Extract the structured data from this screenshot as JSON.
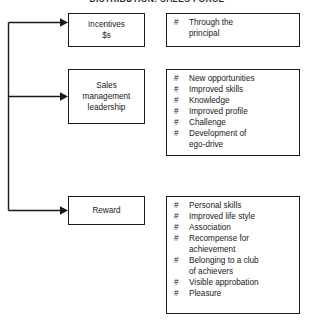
{
  "title": "DISTRIBUTION: SALES FORCE",
  "bullet_marker": "#",
  "colors": {
    "line": "#1a1a1a",
    "text": "#1a1a1a",
    "background": "#ffffff"
  },
  "rows": [
    {
      "driver": {
        "lines": [
          "Incentives",
          "$s"
        ]
      },
      "outcomes": [
        {
          "lines": [
            "Through the",
            "principal"
          ]
        }
      ]
    },
    {
      "driver": {
        "lines": [
          "Sales",
          "management",
          "leadership"
        ]
      },
      "outcomes": [
        {
          "lines": [
            "New opportunities"
          ]
        },
        {
          "lines": [
            "Improved skills"
          ]
        },
        {
          "lines": [
            "Knowledge"
          ]
        },
        {
          "lines": [
            "Improved profile"
          ]
        },
        {
          "lines": [
            "Challenge"
          ]
        },
        {
          "lines": [
            "Development of",
            "ego-drive"
          ]
        }
      ]
    },
    {
      "driver": {
        "lines": [
          "Reward"
        ]
      },
      "outcomes": [
        {
          "lines": [
            "Personal skills"
          ]
        },
        {
          "lines": [
            "Improved life style"
          ]
        },
        {
          "lines": [
            "Association"
          ]
        },
        {
          "lines": [
            "Recompense for",
            "achievement"
          ]
        },
        {
          "lines": [
            "Belonging to a club",
            "of achievers"
          ]
        },
        {
          "lines": [
            "Visible approbation"
          ]
        },
        {
          "lines": [
            "Pleasure"
          ]
        }
      ]
    }
  ]
}
